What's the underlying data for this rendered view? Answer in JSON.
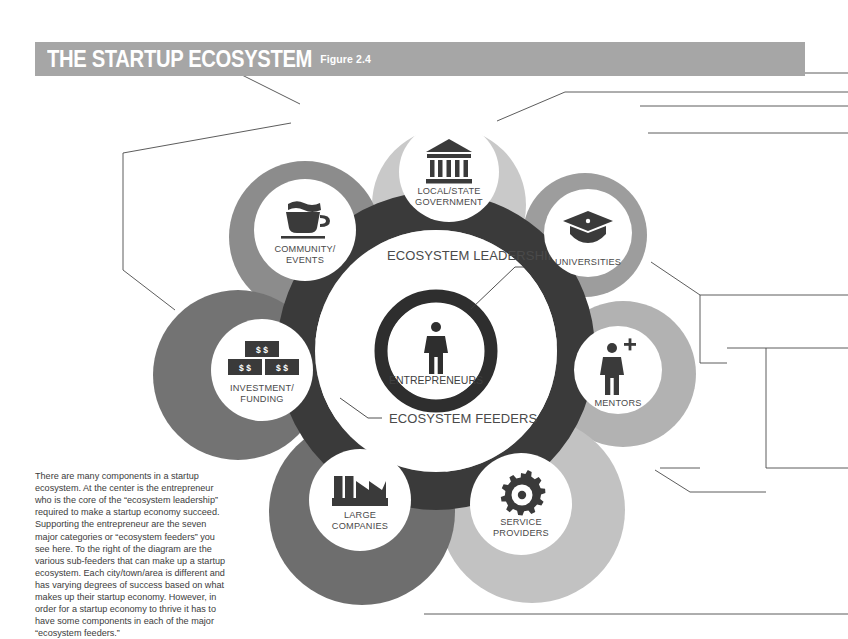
{
  "header": {
    "title": "THE STARTUP ECOSYSTEM",
    "figure_label": "Figure 2.4",
    "banner_color": "#a6a6a6",
    "title_color": "#ffffff"
  },
  "center": {
    "entrepreneurs_label": "ENTREPRENEURS",
    "entrepreneur_icon": "person-icon",
    "leadership_label": "ECOSYSTEM LEADERSHIP",
    "feeders_label": "ECOSYSTEM FEEDERS",
    "ring_color": "#3a3a3a",
    "feeder_ring_color": "#3a3a3a"
  },
  "nodes": [
    {
      "id": "local-state-government",
      "label_line1": "LOCAL/STATE",
      "label_line2": "GOVERNMENT",
      "icon": "bank-building-icon",
      "color": "#c9c9c9"
    },
    {
      "id": "community-events",
      "label_line1": "COMMUNITY/",
      "label_line2": "EVENTS",
      "icon": "coffee-cup-icon",
      "color": "#8c8c8c"
    },
    {
      "id": "universities",
      "label_line1": "UNIVERSITIES",
      "label_line2": "",
      "icon": "graduation-cap-icon",
      "color": "#9d9d9d"
    },
    {
      "id": "mentors",
      "label_line1": "MENTORS",
      "label_line2": "",
      "icon": "person-plus-icon",
      "color": "#b2b2b2"
    },
    {
      "id": "service-providers",
      "label_line1": "SERVICE",
      "label_line2": "PROVIDERS",
      "icon": "gear-icon",
      "color": "#c2c2c2"
    },
    {
      "id": "large-companies",
      "label_line1": "LARGE",
      "label_line2": "COMPANIES",
      "icon": "factory-icon",
      "color": "#6e6e6e"
    },
    {
      "id": "investment-funding",
      "label_line1": "INVESTMENT/",
      "label_line2": "FUNDING",
      "icon": "money-bills-icon",
      "color": "#737373"
    }
  ],
  "money_icon": {
    "bill_top": "$ $",
    "bill_left": "$ $",
    "bill_right": "$ $"
  },
  "body": {
    "paragraph": "There are many components in a startup ecosystem. At the center is the entrepreneur who is the core of the “ecosystem leadership” required to make a startup economy succeed. Supporting the entrepreneur are the seven major categories or “ecosystem feeders” you see here. To the right of the diagram are the various sub-feeders that can make up a startup ecosystem. Each city/town/area is different and has varying degrees of success based on what makes up their startup economy. However, in order for a startup economy to thrive it has to have some components in each of the major “ecosystem feeders.”"
  }
}
